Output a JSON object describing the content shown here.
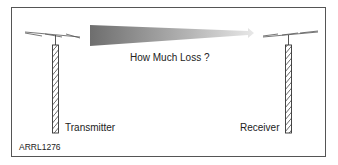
{
  "diagram": {
    "arrow_label": "How Much Loss ?",
    "transmitter_label": "Transmitter",
    "receiver_label": "Receiver",
    "figure_code": "ARRL1276",
    "colors": {
      "frame": "#555555",
      "arrow_start": "#707070",
      "arrow_end": "#e6e6e6",
      "tower": "#333333"
    }
  }
}
